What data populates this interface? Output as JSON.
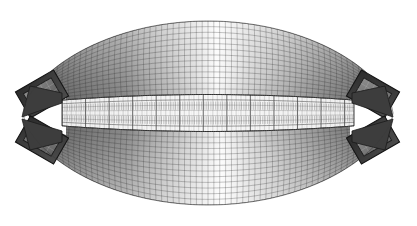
{
  "figure": {
    "kind": "fea-mesh-plan-view",
    "background_color": "#ffffff",
    "canvas": {
      "width": 417,
      "height": 226
    },
    "colors": {
      "shell_dark": "#4f4f4f",
      "shell_mid": "#8e8e8e",
      "shell_light": "#f2f2f2",
      "mesh_line": "#2f2f2f",
      "abutment_block": "#3a3a3a",
      "abutment_inner": "#7a7a7a",
      "deck_band": "#f6f6f6",
      "deck_rib": "#6b6b6b",
      "wedge_highlight": "#ffffff",
      "outline": "#1e1e1e"
    }
  },
  "geometry": {
    "lens": {
      "left_tip_x": 22,
      "right_tip_x": 393,
      "center_x": 208,
      "center_y": 113,
      "top_y": 22,
      "bottom_y": 209,
      "half_width": 185,
      "half_height": 92
    },
    "deck": {
      "left_x": 62,
      "right_x": 354,
      "top_y": 97,
      "bottom_y": 134,
      "taper_inset": 10,
      "rib_count": 62,
      "stringer_rows": 7
    },
    "shell_mesh": {
      "radial_divisions": 64,
      "ring_divisions": 13,
      "upper_rings": 13,
      "lower_rings": 13
    },
    "abutments": [
      {
        "name": "upper-left-abutment",
        "cx": 42,
        "cy": 94,
        "w": 44,
        "h": 30,
        "rotation": -30
      },
      {
        "name": "lower-left-abutment",
        "cx": 42,
        "cy": 140,
        "w": 44,
        "h": 30,
        "rotation": 30
      },
      {
        "name": "upper-right-abutment",
        "cx": 373,
        "cy": 94,
        "w": 44,
        "h": 30,
        "rotation": 30
      },
      {
        "name": "lower-right-abutment",
        "cx": 373,
        "cy": 140,
        "w": 44,
        "h": 30,
        "rotation": -30
      }
    ],
    "notches": [
      {
        "name": "left-notch",
        "x": 22,
        "y": 117
      },
      {
        "name": "right-notch",
        "x": 393,
        "y": 117
      }
    ]
  },
  "chart_data": {
    "type": "mesh",
    "xlabel": "",
    "ylabel": "",
    "grid": true,
    "legend": "none",
    "shading": {
      "scheme": "grayscale",
      "upper_gradient_stops": [
        "#4a4a4a",
        "#9a9a9a",
        "#fafafa",
        "#9a9a9a",
        "#4a4a4a"
      ],
      "lower_gradient_stops": [
        "#4a4a4a",
        "#9a9a9a",
        "#fafafa",
        "#9a9a9a",
        "#4a4a4a"
      ],
      "highlight_position": "center"
    }
  }
}
